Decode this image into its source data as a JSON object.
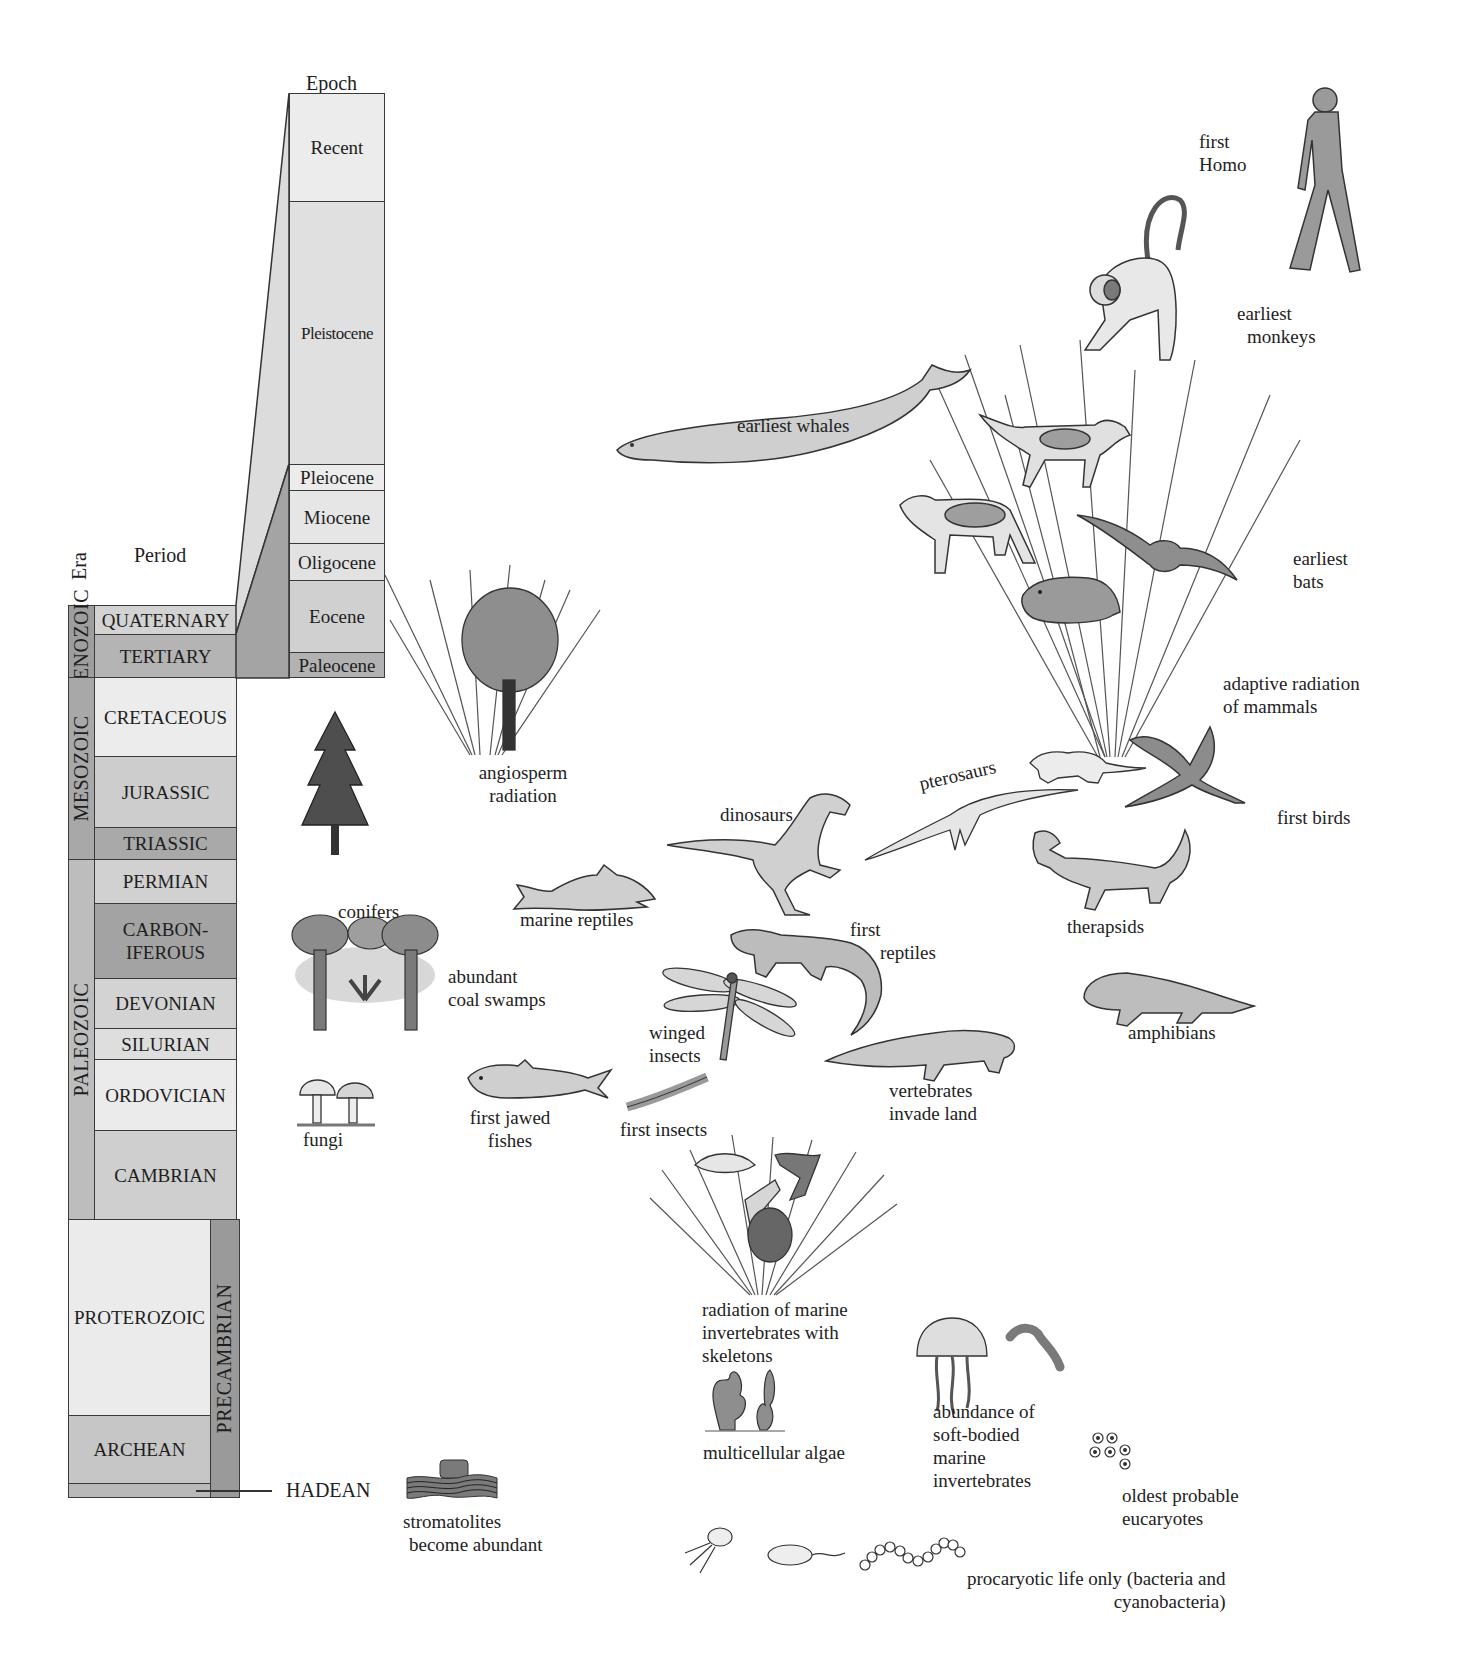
{
  "headers": {
    "era": "Era",
    "period": "Period",
    "epoch": "Epoch"
  },
  "eras": [
    {
      "name": "CENOZOIC"
    },
    {
      "name": "MESOZOIC"
    },
    {
      "name": "PALEOZOIC"
    },
    {
      "name": "PRECAMBRIAN"
    }
  ],
  "periods": [
    {
      "name": "QUATERNARY"
    },
    {
      "name": "TERTIARY"
    },
    {
      "name": "CRETACEOUS"
    },
    {
      "name": "JURASSIC"
    },
    {
      "name": "TRIASSIC"
    },
    {
      "name": "PERMIAN"
    },
    {
      "name": "CARBON-\nIFEROUS",
      "line1": "CARBON-",
      "line2": "IFEROUS"
    },
    {
      "name": "DEVONIAN"
    },
    {
      "name": "SILURIAN"
    },
    {
      "name": "ORDOVICIAN"
    },
    {
      "name": "CAMBRIAN"
    },
    {
      "name": "PROTEROZOIC"
    },
    {
      "name": "ARCHEAN"
    },
    {
      "name": "HADEAN"
    }
  ],
  "epochs": [
    {
      "name": "Recent"
    },
    {
      "name": "Pleistocene"
    },
    {
      "name": "Pleiocene"
    },
    {
      "name": "Miocene"
    },
    {
      "name": "Oligocene"
    },
    {
      "name": "Eocene"
    },
    {
      "name": "Paleocene"
    }
  ],
  "life_events": [
    {
      "id": "first-homo",
      "line1": "first",
      "line2": "Homo"
    },
    {
      "id": "earliest-monkeys",
      "line1": "earliest",
      "line2": "monkeys"
    },
    {
      "id": "earliest-whales",
      "line1": "earliest whales"
    },
    {
      "id": "earliest-bats",
      "line1": "earliest",
      "line2": "bats"
    },
    {
      "id": "adaptive-radiation-mammals",
      "line1": "adaptive radiation",
      "line2": "of mammals"
    },
    {
      "id": "first-birds",
      "line1": "first birds"
    },
    {
      "id": "pterosaurs",
      "line1": "pterosaurs"
    },
    {
      "id": "dinosaurs",
      "line1": "dinosaurs"
    },
    {
      "id": "angiosperm-radiation",
      "line1": "angiosperm",
      "line2": "radiation"
    },
    {
      "id": "conifers",
      "line1": "conifers"
    },
    {
      "id": "marine-reptiles",
      "line1": "marine reptiles"
    },
    {
      "id": "therapsids",
      "line1": "therapsids"
    },
    {
      "id": "first-reptiles",
      "line1": "first",
      "line2": "reptiles"
    },
    {
      "id": "abundant-coal-swamps",
      "line1": "abundant",
      "line2": "coal swamps"
    },
    {
      "id": "winged-insects",
      "line1": "winged",
      "line2": "insects"
    },
    {
      "id": "amphibians",
      "line1": "amphibians"
    },
    {
      "id": "vertebrates-invade-land",
      "line1": "vertebrates",
      "line2": "invade land"
    },
    {
      "id": "fungi",
      "line1": "fungi"
    },
    {
      "id": "first-jawed-fishes",
      "line1": "first jawed",
      "line2": "fishes"
    },
    {
      "id": "first-insects",
      "line1": "first insects"
    },
    {
      "id": "radiation-marine-invertebrates",
      "line1": "radiation of marine",
      "line2": "invertebrates with",
      "line3": "skeletons"
    },
    {
      "id": "multicellular-algae",
      "line1": "multicellular algae"
    },
    {
      "id": "soft-bodied-invertebrates",
      "line1": "abundance of",
      "line2": "soft-bodied",
      "line3": "marine",
      "line4": "invertebrates"
    },
    {
      "id": "oldest-eucaryotes",
      "line1": "oldest probable",
      "line2": "eucaryotes"
    },
    {
      "id": "stromatolites",
      "line1": "stromatolites",
      "line2": "become abundant"
    },
    {
      "id": "procaryotic-life",
      "line1": "procaryotic life only (bacteria and",
      "line2": "cyanobacteria)"
    }
  ],
  "colors": {
    "light": "#e4e4e4",
    "medium": "#c9c9c9",
    "dark": "#9e9e9e",
    "border": "#3a3a3a",
    "ink": "#1e1e1e"
  }
}
